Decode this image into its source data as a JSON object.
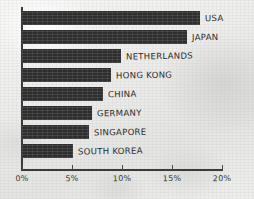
{
  "chart_data": {
    "type": "bar",
    "orientation": "horizontal",
    "title": "",
    "subtitle": "",
    "xlabel": "",
    "ylabel": "",
    "xlim": [
      0,
      20
    ],
    "grid": false,
    "legend": null,
    "style": "hand-drawn sketch on paper texture",
    "bar_color": "#2e2e2e",
    "axis_color": "#3b3b3b",
    "categories": [
      "USA",
      "JAPAN",
      "NETHERLANDS",
      "HONG KONG",
      "CHINA",
      "GERMANY",
      "SINGAPORE",
      "SOUTH KOREA"
    ],
    "values": [
      17.8,
      16.5,
      9.9,
      8.9,
      8.1,
      7.0,
      6.7,
      5.1
    ],
    "value_unit": "%",
    "x_ticks": [
      0,
      5,
      10,
      15,
      20
    ],
    "x_tick_labels": [
      "0%",
      "5%",
      "10%",
      "15%",
      "20%"
    ]
  },
  "axis": {
    "ticks": [
      {
        "value": 0,
        "label": "0%"
      },
      {
        "value": 5,
        "label": "5%"
      },
      {
        "value": 10,
        "label": "10%"
      },
      {
        "value": 15,
        "label": "15%"
      },
      {
        "value": 20,
        "label": "20%"
      }
    ]
  },
  "bars": [
    {
      "label": "USA",
      "value": 17.8
    },
    {
      "label": "JAPAN",
      "value": 16.5
    },
    {
      "label": "NETHERLANDS",
      "value": 9.9
    },
    {
      "label": "HONG KONG",
      "value": 8.9
    },
    {
      "label": "CHINA",
      "value": 8.1
    },
    {
      "label": "GERMANY",
      "value": 7.0
    },
    {
      "label": "SINGAPORE",
      "value": 6.7
    },
    {
      "label": "SOUTH KOREA",
      "value": 5.1
    }
  ]
}
